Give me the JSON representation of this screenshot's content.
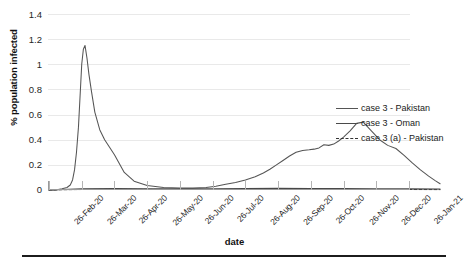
{
  "chart_data": {
    "type": "line",
    "title": "",
    "xlabel": "date",
    "ylabel": "% population infected",
    "ylim": [
      0,
      1.4
    ],
    "yticks": [
      "0",
      "0.2",
      "0.4",
      "0.6",
      "0.8",
      "1",
      "1.2",
      "1.4"
    ],
    "grid": true,
    "legend_position": "right-middle",
    "categories": [
      "26-Feb-20",
      "26-Mar-20",
      "26-Apr-20",
      "26-May-20",
      "26-Jun-20",
      "26-Jul-20",
      "26-Aug-20",
      "26-Sep-20",
      "26-Oct-20",
      "26-Nov-20",
      "26-Dec-20",
      "26-Jan-21"
    ],
    "series": [
      {
        "name": "case 3 - Pakistan",
        "style": "solid",
        "color": "#555555",
        "x": [
          0.0,
          0.2,
          0.4,
          0.55,
          0.65,
          0.72,
          0.78,
          0.84,
          0.9,
          0.95,
          1.0,
          1.05,
          1.1,
          1.16,
          1.22,
          1.3,
          1.4,
          1.55,
          1.7,
          1.85,
          2.0,
          2.3,
          2.6,
          3.0,
          3.5,
          4.0,
          4.4,
          4.8,
          5.1,
          5.4,
          5.7,
          6.0,
          6.3,
          6.55,
          6.75,
          6.95,
          7.15,
          7.35,
          7.55,
          7.75,
          7.95,
          8.1,
          8.25,
          8.4,
          8.55,
          8.7,
          8.85,
          9.0,
          9.2,
          9.4,
          9.6,
          9.85,
          10.1,
          10.35,
          10.6,
          10.85,
          11.1,
          11.35,
          11.6,
          11.8,
          11.95
        ],
        "y": [
          0.0,
          0.0,
          0.01,
          0.02,
          0.04,
          0.08,
          0.16,
          0.3,
          0.5,
          0.75,
          1.0,
          1.12,
          1.15,
          1.05,
          0.92,
          0.78,
          0.62,
          0.48,
          0.4,
          0.34,
          0.28,
          0.14,
          0.07,
          0.035,
          0.02,
          0.015,
          0.015,
          0.02,
          0.03,
          0.045,
          0.06,
          0.08,
          0.105,
          0.135,
          0.165,
          0.2,
          0.235,
          0.27,
          0.3,
          0.315,
          0.32,
          0.325,
          0.335,
          0.36,
          0.355,
          0.365,
          0.39,
          0.42,
          0.47,
          0.53,
          0.54,
          0.47,
          0.4,
          0.355,
          0.33,
          0.275,
          0.215,
          0.16,
          0.11,
          0.075,
          0.05
        ]
      },
      {
        "name": "case 3 - Oman",
        "style": "solid",
        "color": "#4a4a4a",
        "x": [
          0.0,
          1.0,
          2.0,
          3.0,
          4.0,
          5.0,
          6.0,
          7.0,
          8.0,
          9.0,
          10.0,
          11.0,
          11.95
        ],
        "y": [
          0.0,
          0.01,
          0.012,
          0.01,
          0.009,
          0.01,
          0.012,
          0.013,
          0.012,
          0.011,
          0.01,
          0.009,
          0.008
        ]
      },
      {
        "name": "case 3 (a) - Pakistan",
        "style": "dashed",
        "color": "#333333",
        "x": [
          0.0,
          1.0,
          2.0,
          3.0,
          4.0,
          5.0,
          6.0,
          7.0,
          8.0,
          9.0,
          10.0,
          11.0,
          11.95
        ],
        "y": [
          0.0,
          0.004,
          0.005,
          0.005,
          0.004,
          0.004,
          0.005,
          0.005,
          0.005,
          0.004,
          0.004,
          0.004,
          0.003
        ]
      }
    ]
  },
  "legend": {
    "items": [
      {
        "label": "case 3 - Pakistan"
      },
      {
        "label": "case 3 - Oman"
      },
      {
        "label": "case 3 (a) - Pakistan"
      }
    ]
  }
}
